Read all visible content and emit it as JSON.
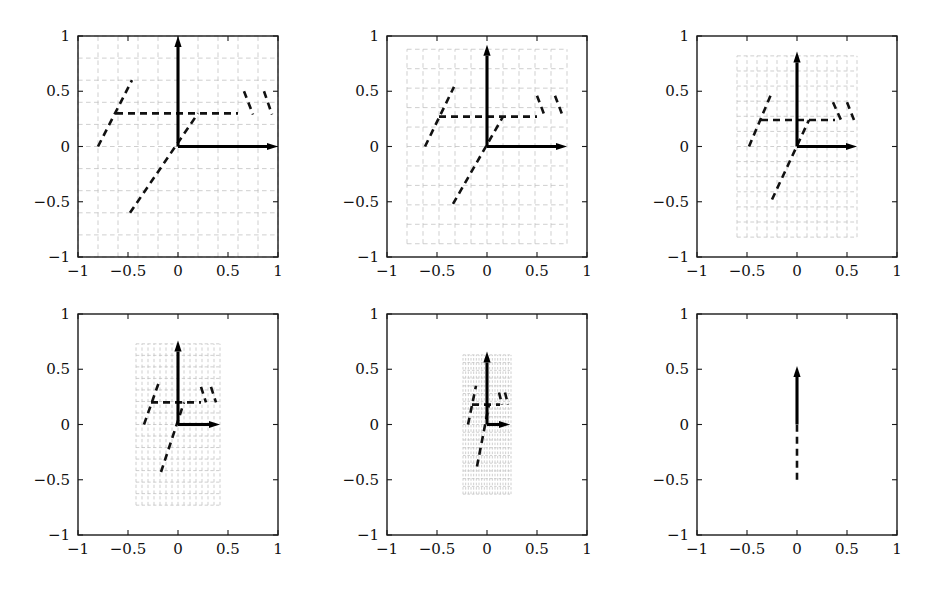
{
  "figure": {
    "width": 931,
    "height": 594,
    "background": "#ffffff",
    "panel_count": 6,
    "rows": 2,
    "cols": 3
  },
  "style": {
    "frame_color": "#1a1a1a",
    "grid_color": "#bfbfbf",
    "vector_color": "#000000",
    "dashed_color": "#111111",
    "tick_label_color": "#111111"
  },
  "axes": {
    "xlim": [
      -1,
      1
    ],
    "ylim": [
      -1,
      1
    ],
    "xticks": [
      -1,
      -0.5,
      0,
      0.5,
      1
    ],
    "yticks": [
      -1,
      -0.5,
      0,
      0.5,
      1
    ],
    "xticklabels": [
      "-1",
      "-0.5",
      "0",
      "0.5",
      "1"
    ],
    "yticklabels": [
      "-1",
      "-0.5",
      "0",
      "0.5",
      "1"
    ],
    "grid": false,
    "box": true
  },
  "chart_data": {
    "type": "line",
    "title": "",
    "xlabel": "",
    "ylabel": "",
    "xlim": [
      -1,
      1
    ],
    "ylim": [
      -1,
      1
    ],
    "categories": [
      "panel 1",
      "panel 2",
      "panel 3",
      "panel 4",
      "panel 5",
      "panel 6"
    ],
    "values": [
      1.0,
      0.8,
      0.6,
      0.42,
      0.24,
      0.0
    ],
    "series": [
      {
        "name": "grid half-width (x extent)",
        "values": [
          1.0,
          0.8,
          0.6,
          0.42,
          0.24,
          0.0
        ]
      },
      {
        "name": "grid half-height (y extent)",
        "values": [
          1.0,
          0.88,
          0.82,
          0.73,
          0.63,
          0.5
        ]
      },
      {
        "name": "grid cell count per side",
        "values": [
          10,
          10,
          12,
          14,
          18,
          0
        ]
      }
    ],
    "panels": [
      {
        "index": 1,
        "label": "panel 1",
        "grid": {
          "x_half": 1.0,
          "y_half": 1.0,
          "shear": 0.0,
          "cells": 10,
          "visible": true
        },
        "vectors": [
          {
            "name": "vertical-eigenvector",
            "x0": 0,
            "y0": 0,
            "x1": 0,
            "y1": 1.0
          },
          {
            "name": "horizontal-eigenvector",
            "x0": 0,
            "y0": 0,
            "x1": 1.0,
            "y1": 0
          }
        ],
        "dashed_segments": [
          {
            "name": "lower-diagonal",
            "x0": -0.48,
            "y0": -0.6,
            "x1": 0.2,
            "y1": 0.3
          },
          {
            "name": "upper-diagonal",
            "x0": -0.8,
            "y0": 0.0,
            "x1": -0.46,
            "y1": 0.6
          },
          {
            "name": "horizontal-band",
            "x0": -0.62,
            "y0": 0.3,
            "x1": 0.6,
            "y1": 0.3
          },
          {
            "name": "right-diagonal-a",
            "x0": 0.66,
            "y0": 0.5,
            "x1": 0.75,
            "y1": 0.29
          },
          {
            "name": "right-diagonal-b",
            "x0": 0.86,
            "y0": 0.5,
            "x1": 0.94,
            "y1": 0.29
          }
        ]
      },
      {
        "index": 2,
        "label": "panel 2",
        "grid": {
          "x_half": 0.8,
          "y_half": 0.88,
          "shear": 0.0,
          "cells": 10,
          "visible": true
        },
        "vectors": [
          {
            "name": "vertical-eigenvector",
            "x0": 0,
            "y0": 0,
            "x1": 0,
            "y1": 0.92
          },
          {
            "name": "horizontal-eigenvector",
            "x0": 0,
            "y0": 0,
            "x1": 0.8,
            "y1": 0
          }
        ],
        "dashed_segments": [
          {
            "name": "lower-diagonal",
            "x0": -0.34,
            "y0": -0.52,
            "x1": 0.16,
            "y1": 0.27
          },
          {
            "name": "upper-diagonal",
            "x0": -0.62,
            "y0": 0.0,
            "x1": -0.33,
            "y1": 0.54
          },
          {
            "name": "horizontal-band",
            "x0": -0.48,
            "y0": 0.27,
            "x1": 0.5,
            "y1": 0.27
          },
          {
            "name": "right-diagonal-a",
            "x0": 0.5,
            "y0": 0.46,
            "x1": 0.58,
            "y1": 0.27
          },
          {
            "name": "right-diagonal-b",
            "x0": 0.68,
            "y0": 0.46,
            "x1": 0.76,
            "y1": 0.27
          }
        ]
      },
      {
        "index": 3,
        "label": "panel 3",
        "grid": {
          "x_half": 0.6,
          "y_half": 0.82,
          "shear": 0.0,
          "cells": 12,
          "visible": true
        },
        "vectors": [
          {
            "name": "vertical-eigenvector",
            "x0": 0,
            "y0": 0,
            "x1": 0,
            "y1": 0.86
          },
          {
            "name": "horizontal-eigenvector",
            "x0": 0,
            "y0": 0,
            "x1": 0.6,
            "y1": 0
          }
        ],
        "dashed_segments": [
          {
            "name": "lower-diagonal",
            "x0": -0.25,
            "y0": -0.48,
            "x1": 0.12,
            "y1": 0.24
          },
          {
            "name": "upper-diagonal",
            "x0": -0.48,
            "y0": 0.0,
            "x1": -0.26,
            "y1": 0.47
          },
          {
            "name": "horizontal-band",
            "x0": -0.36,
            "y0": 0.24,
            "x1": 0.38,
            "y1": 0.24
          },
          {
            "name": "right-diagonal-a",
            "x0": 0.36,
            "y0": 0.4,
            "x1": 0.44,
            "y1": 0.24
          },
          {
            "name": "right-diagonal-b",
            "x0": 0.5,
            "y0": 0.4,
            "x1": 0.57,
            "y1": 0.24
          }
        ]
      },
      {
        "index": 4,
        "label": "panel 4",
        "grid": {
          "x_half": 0.42,
          "y_half": 0.73,
          "shear": 0.0,
          "cells": 14,
          "visible": true
        },
        "vectors": [
          {
            "name": "vertical-eigenvector",
            "x0": 0,
            "y0": 0,
            "x1": 0,
            "y1": 0.76
          },
          {
            "name": "horizontal-eigenvector",
            "x0": 0,
            "y0": 0,
            "x1": 0.42,
            "y1": 0
          }
        ],
        "dashed_segments": [
          {
            "name": "lower-diagonal",
            "x0": -0.17,
            "y0": -0.43,
            "x1": 0.06,
            "y1": 0.2
          },
          {
            "name": "upper-diagonal",
            "x0": -0.34,
            "y0": 0.0,
            "x1": -0.18,
            "y1": 0.41
          },
          {
            "name": "horizontal-band",
            "x0": -0.27,
            "y0": 0.2,
            "x1": 0.23,
            "y1": 0.2
          },
          {
            "name": "right-diagonal-a",
            "x0": 0.23,
            "y0": 0.34,
            "x1": 0.28,
            "y1": 0.2
          },
          {
            "name": "right-diagonal-b",
            "x0": 0.33,
            "y0": 0.34,
            "x1": 0.38,
            "y1": 0.2
          }
        ]
      },
      {
        "index": 5,
        "label": "panel 5",
        "grid": {
          "x_half": 0.24,
          "y_half": 0.63,
          "shear": 0.0,
          "cells": 18,
          "visible": true
        },
        "vectors": [
          {
            "name": "vertical-eigenvector",
            "x0": 0,
            "y0": 0,
            "x1": 0,
            "y1": 0.66
          },
          {
            "name": "horizontal-eigenvector",
            "x0": 0,
            "y0": 0,
            "x1": 0.23,
            "y1": 0
          }
        ],
        "dashed_segments": [
          {
            "name": "lower-diagonal",
            "x0": -0.1,
            "y0": -0.38,
            "x1": 0.02,
            "y1": 0.18
          },
          {
            "name": "upper-diagonal",
            "x0": -0.19,
            "y0": 0.0,
            "x1": -0.11,
            "y1": 0.35
          },
          {
            "name": "horizontal-band",
            "x0": -0.15,
            "y0": 0.18,
            "x1": 0.13,
            "y1": 0.18
          },
          {
            "name": "right-diagonal-a",
            "x0": 0.12,
            "y0": 0.29,
            "x1": 0.15,
            "y1": 0.18
          },
          {
            "name": "right-diagonal-b",
            "x0": 0.18,
            "y0": 0.29,
            "x1": 0.21,
            "y1": 0.18
          }
        ]
      },
      {
        "index": 6,
        "label": "panel 6",
        "grid": {
          "x_half": 0.0,
          "y_half": 0.5,
          "shear": 0.0,
          "cells": 0,
          "visible": false
        },
        "vectors": [
          {
            "name": "vertical-eigenvector",
            "x0": 0,
            "y0": 0,
            "x1": 0,
            "y1": 0.53
          }
        ],
        "dashed_segments": [
          {
            "name": "collapsed-line",
            "x0": 0.0,
            "y0": -0.5,
            "x1": 0.0,
            "y1": 0.0
          }
        ]
      }
    ]
  }
}
